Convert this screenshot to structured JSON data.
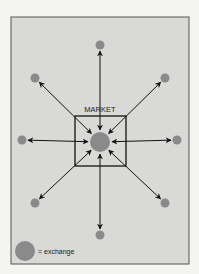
{
  "diagram": {
    "title": "MARKET",
    "legend_label": "= exchange",
    "colors": {
      "background": "#f4f4f2",
      "panel": "#d9d9d7",
      "frame": "#555555",
      "dot": "#8a8a8a",
      "arrow": "#111111"
    },
    "center": {
      "x": 100,
      "y": 142,
      "r": 10
    },
    "box": {
      "x": 75,
      "y": 116,
      "w": 51,
      "h": 50
    },
    "outer_nodes": [
      {
        "name": "top",
        "x": 100,
        "y": 45
      },
      {
        "name": "upper-right",
        "x": 165,
        "y": 78
      },
      {
        "name": "right",
        "x": 177,
        "y": 140
      },
      {
        "name": "lower-right",
        "x": 165,
        "y": 203
      },
      {
        "name": "bottom",
        "x": 100,
        "y": 235
      },
      {
        "name": "lower-left",
        "x": 35,
        "y": 203
      },
      {
        "name": "left",
        "x": 22,
        "y": 140
      },
      {
        "name": "upper-left",
        "x": 35,
        "y": 78
      }
    ]
  }
}
